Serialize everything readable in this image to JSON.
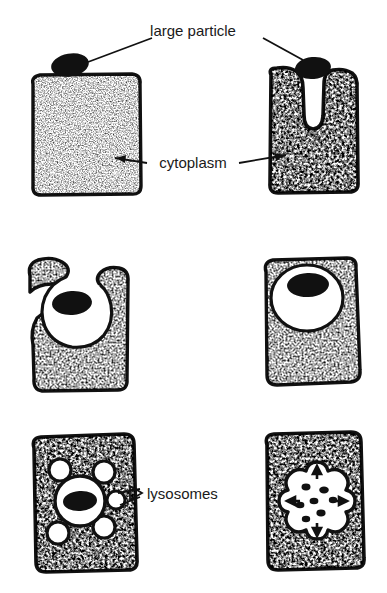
{
  "figure": {
    "background_color": "#ffffff",
    "ink_color": "#111111",
    "cytoplasm_fill": "#9e9e9e",
    "vacuole_fill": "#ffffff",
    "particle_fill": "#111111"
  },
  "labels": {
    "large_particle": "large particle",
    "cytoplasm": "cytoplasm",
    "lysosomes": "lysosomes"
  },
  "panels": [
    {
      "id": "panel-1",
      "position": "top-left",
      "stage": "free particle outside cell",
      "caption_refs": [
        "large particle",
        "cytoplasm"
      ],
      "particle_inside": false,
      "lysosome_count": 0,
      "texture_density": "light"
    },
    {
      "id": "panel-2",
      "position": "top-right",
      "stage": "membrane invagination forming cup around particle",
      "caption_refs": [
        "large particle",
        "cytoplasm"
      ],
      "particle_inside": false,
      "lysosome_count": 0,
      "texture_density": "heavy"
    },
    {
      "id": "panel-3",
      "position": "middle-left",
      "stage": "pseudopods nearly enclose particle in forming vacuole",
      "caption_refs": [],
      "particle_inside": true,
      "lysosome_count": 0,
      "texture_density": "medium"
    },
    {
      "id": "panel-4",
      "position": "middle-right",
      "stage": "phagocytic vacuole fully sealed inside cell",
      "caption_refs": [],
      "particle_inside": true,
      "lysosome_count": 0,
      "texture_density": "medium"
    },
    {
      "id": "panel-5",
      "position": "bottom-left",
      "stage": "lysosomes approach and attach to the vacuole",
      "caption_refs": [
        "lysosomes"
      ],
      "particle_inside": true,
      "lysosome_count": 5,
      "texture_density": "heavy"
    },
    {
      "id": "panel-6",
      "position": "bottom-right",
      "stage": "lysosomes fuse and digest particle into fragments",
      "caption_refs": [],
      "particle_inside": true,
      "lysosome_count": 4,
      "fragment_count": 7,
      "texture_density": "heavy"
    }
  ]
}
